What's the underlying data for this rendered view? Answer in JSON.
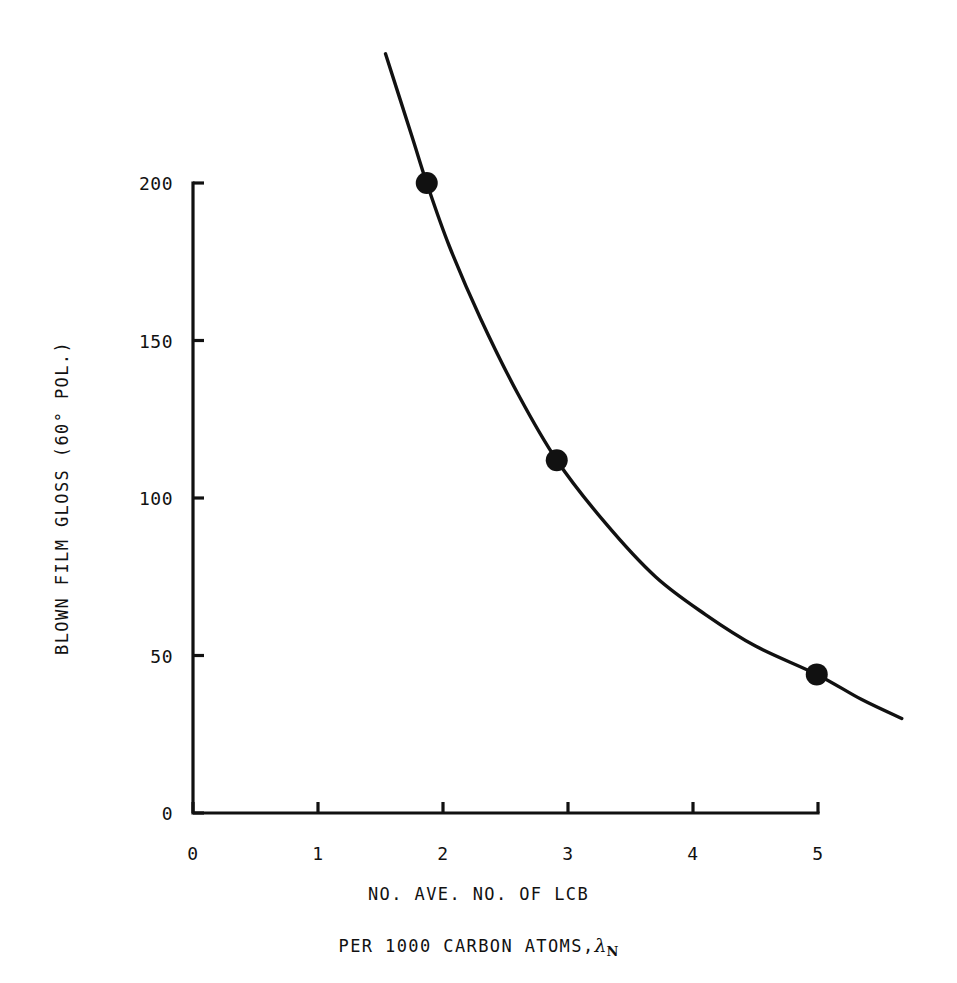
{
  "figure": {
    "background_color": "#ffffff",
    "ink_color": "#111111"
  },
  "chart_data": {
    "type": "line",
    "title": "",
    "subtitle": "",
    "xlabel_line1": "NO. AVE. NO. OF LCB",
    "xlabel_line2_prefix": "PER 1000 CARBON ATOMS,",
    "xlabel_symbol": "λ",
    "xlabel_symbol_sub": "N",
    "ylabel": "BLOWN FILM GLOSS (60° POL.)",
    "xlim": [
      0,
      5
    ],
    "ylim": [
      0,
      200
    ],
    "xticks": [
      0,
      1,
      2,
      3,
      4,
      5
    ],
    "xtick_labels": [
      "0",
      "1",
      "2",
      "3",
      "4",
      "5"
    ],
    "yticks": [
      0,
      50,
      100,
      150,
      200
    ],
    "ytick_labels": [
      "0",
      "50",
      "100",
      "150",
      "200"
    ],
    "grid": false,
    "legend": "none",
    "series": [
      {
        "name": "Blown film gloss vs LCB",
        "marker": "filled-circle",
        "marker_size_px": 22,
        "line_color": "#111111",
        "line_width_px": 3.4,
        "points": [
          {
            "x": 1.87,
            "y": 200
          },
          {
            "x": 2.91,
            "y": 112
          },
          {
            "x": 4.99,
            "y": 44
          }
        ],
        "curve": [
          {
            "x": 1.54,
            "y": 241
          },
          {
            "x": 1.75,
            "y": 215
          },
          {
            "x": 1.87,
            "y": 200
          },
          {
            "x": 2.05,
            "y": 180
          },
          {
            "x": 2.3,
            "y": 157
          },
          {
            "x": 2.6,
            "y": 133
          },
          {
            "x": 2.91,
            "y": 112
          },
          {
            "x": 3.3,
            "y": 92
          },
          {
            "x": 3.7,
            "y": 75
          },
          {
            "x": 4.1,
            "y": 63
          },
          {
            "x": 4.5,
            "y": 53
          },
          {
            "x": 4.99,
            "y": 44
          },
          {
            "x": 5.35,
            "y": 36
          },
          {
            "x": 5.67,
            "y": 30
          }
        ]
      }
    ]
  },
  "axes_geometry": {
    "plot_left_px": 193,
    "plot_right_px": 818,
    "plot_bottom_px": 813,
    "plot_top_px": 183,
    "tick_length_px": 11,
    "axis_line_width_px": 3.2
  }
}
